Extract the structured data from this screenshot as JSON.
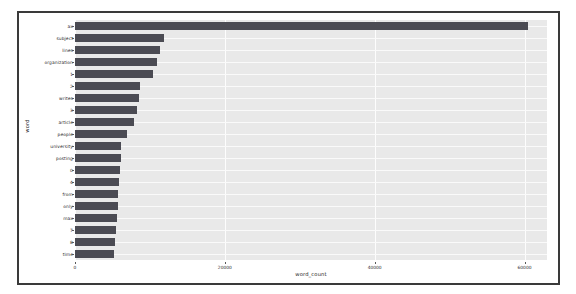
{
  "figure": {
    "background": "#ffffff",
    "plot_background": "#e9e9e9",
    "bar_color": "#4b4b53",
    "grid_color": "#fdfdfd",
    "border_color": "#3a3a3a"
  },
  "chart_data": {
    "type": "bar",
    "orientation": "horizontal",
    "title": "",
    "xlabel": "word_count",
    "ylabel": "word",
    "xlim": [
      0,
      63000
    ],
    "xticks": [
      0,
      20000,
      40000,
      60000
    ],
    "xtick_labels": [
      "0",
      "20000",
      "40000",
      "60000"
    ],
    "grid": true,
    "legend": null,
    "categories": [
      "ax",
      "subject",
      "lines",
      "organization",
      "1",
      "2",
      "writes",
      "3",
      "article",
      "people",
      "university",
      "posting",
      "0",
      "4",
      "from",
      "only",
      "max",
      "7",
      "8",
      "time"
    ],
    "values": [
      60500,
      11900,
      11400,
      11000,
      10400,
      8700,
      8600,
      8300,
      7900,
      6900,
      6200,
      6100,
      6000,
      5900,
      5800,
      5700,
      5600,
      5500,
      5300,
      5200
    ]
  }
}
